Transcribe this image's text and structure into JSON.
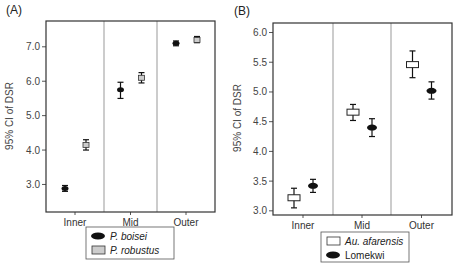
{
  "chart_data": [
    {
      "type": "scatter",
      "subtype": "errorbar",
      "panel_label": "(A)",
      "title": "",
      "xlabel": "",
      "ylabel": "95% CI of DSR",
      "categories": [
        "Inner",
        "Mid",
        "Outer"
      ],
      "yticks": [
        "3.0",
        "4.0",
        "5.0",
        "6.0",
        "7.0"
      ],
      "ytick_values": [
        3.0,
        4.0,
        5.0,
        6.0,
        7.0
      ],
      "ylim": [
        2.2,
        7.75
      ],
      "grid": false,
      "category_separators": true,
      "legend_position": "bottom-center",
      "series": [
        {
          "name": "P. boisei",
          "italic": true,
          "marker": "filled-ellipse",
          "color": "#111111",
          "values": [
            2.88,
            5.75,
            7.1
          ],
          "lower": [
            2.8,
            5.5,
            7.03
          ],
          "upper": [
            2.97,
            5.97,
            7.17
          ]
        },
        {
          "name": "P. robustus",
          "italic": true,
          "marker": "gray-square",
          "color": "#cccccc",
          "values": [
            4.15,
            6.1,
            7.2
          ],
          "lower": [
            4.0,
            5.95,
            7.12
          ],
          "upper": [
            4.3,
            6.25,
            7.3
          ]
        }
      ]
    },
    {
      "type": "scatter",
      "subtype": "errorbar",
      "panel_label": "(B)",
      "title": "",
      "xlabel": "",
      "ylabel": "95% CI of DSR",
      "categories": [
        "Inner",
        "Mid",
        "Outer"
      ],
      "yticks": [
        "3.0",
        "3.5",
        "4.0",
        "4.5",
        "5.0",
        "5.5",
        "6.0"
      ],
      "ytick_values": [
        3.0,
        3.5,
        4.0,
        4.5,
        5.0,
        5.5,
        6.0
      ],
      "ylim": [
        2.93,
        6.16
      ],
      "grid": false,
      "category_separators": true,
      "legend_position": "bottom-center",
      "series": [
        {
          "name": "Au. afarensis",
          "italic": true,
          "marker": "open-rect",
          "color": "#ffffff",
          "values": [
            3.22,
            4.66,
            5.46
          ],
          "lower": [
            3.05,
            4.52,
            5.24
          ],
          "upper": [
            3.38,
            4.79,
            5.69
          ]
        },
        {
          "name": "Lomekwi",
          "italic": false,
          "marker": "filled-ellipse",
          "color": "#111111",
          "values": [
            3.42,
            4.4,
            5.02
          ],
          "lower": [
            3.31,
            4.25,
            4.88
          ],
          "upper": [
            3.53,
            4.55,
            5.17
          ]
        }
      ]
    }
  ]
}
